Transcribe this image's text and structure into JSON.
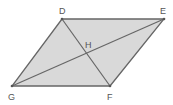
{
  "diagram": {
    "type": "parallelogram",
    "fill_color": "#d9d9d9",
    "stroke_color": "#666666",
    "vertices": [
      {
        "label": "D",
        "x": 62,
        "y": 19,
        "label_x": 60,
        "label_y": 14
      },
      {
        "label": "E",
        "x": 164,
        "y": 19,
        "label_x": 161,
        "label_y": 14
      },
      {
        "label": "F",
        "x": 110,
        "y": 86,
        "label_x": 107,
        "label_y": 100
      },
      {
        "label": "G",
        "x": 12,
        "y": 86,
        "label_x": 8,
        "label_y": 100
      }
    ],
    "intersection": {
      "label": "H",
      "x": 87,
      "y": 53,
      "label_x": 85,
      "label_y": 48
    },
    "diagonals": [
      "DF",
      "GE"
    ]
  }
}
